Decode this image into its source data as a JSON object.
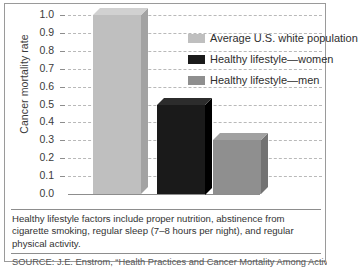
{
  "chart_data": {
    "type": "bar",
    "title": "",
    "xlabel": "",
    "ylabel": "Cancer mortality rate",
    "ylim": [
      0.0,
      1.0
    ],
    "grid": true,
    "legend_position": "upper right inside plot",
    "categories": [
      "Average U.S. white population",
      "Healthy lifestyle—women",
      "Healthy lifestyle—men"
    ],
    "values": [
      1.0,
      0.5,
      0.3
    ],
    "colors": [
      "#bfbfbf",
      "#1a1a1a",
      "#8f8f8f"
    ],
    "yticks": [
      "1.0",
      "0.9",
      "0.8",
      "0.7",
      "0.6",
      "0.5",
      "0.4",
      "0.3",
      "0.2",
      "0.1",
      "0.0"
    ],
    "ytick_values": [
      1.0,
      0.9,
      0.8,
      0.7,
      0.6,
      0.5,
      0.4,
      0.3,
      0.2,
      0.1,
      0.0
    ]
  },
  "legend": {
    "items": [
      {
        "label": "Average U.S. white population",
        "color": "#bfbfbf"
      },
      {
        "label": "Healthy lifestyle—women",
        "color": "#1a1a1a"
      },
      {
        "label": "Healthy lifestyle—men",
        "color": "#8f8f8f"
      }
    ]
  },
  "caption": {
    "text": "Healthy lifestyle factors include proper nutrition, abstinence from cigarette smoking, regular sleep (7–8 hours per night), and regular physical activity."
  },
  "source": {
    "text": "SOURCE: J.E. Enstrom, “Health Practices and Cancer Mortality Among Active…"
  }
}
